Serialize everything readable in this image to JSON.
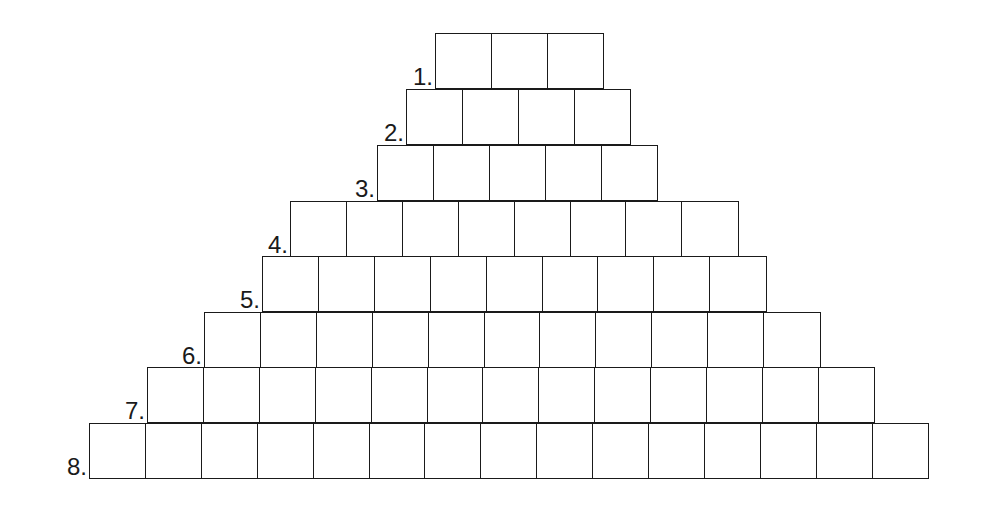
{
  "puzzle": {
    "type": "pyramid word grid",
    "rows": [
      {
        "label": "1.",
        "cells": 3,
        "left": 435,
        "top": 33
      },
      {
        "label": "2.",
        "cells": 4,
        "left": 406,
        "top": 89
      },
      {
        "label": "3.",
        "cells": 5,
        "left": 377,
        "top": 145
      },
      {
        "label": "4.",
        "cells": 8,
        "left": 290,
        "top": 201
      },
      {
        "label": "5.",
        "cells": 9,
        "left": 262,
        "top": 256
      },
      {
        "label": "6.",
        "cells": 11,
        "left": 204,
        "top": 312
      },
      {
        "label": "7.",
        "cells": 13,
        "left": 147,
        "top": 367
      },
      {
        "label": "8.",
        "cells": 15,
        "left": 89,
        "top": 423
      }
    ],
    "colors": {
      "line": "#1a1a1a",
      "background": "#ffffff"
    }
  }
}
